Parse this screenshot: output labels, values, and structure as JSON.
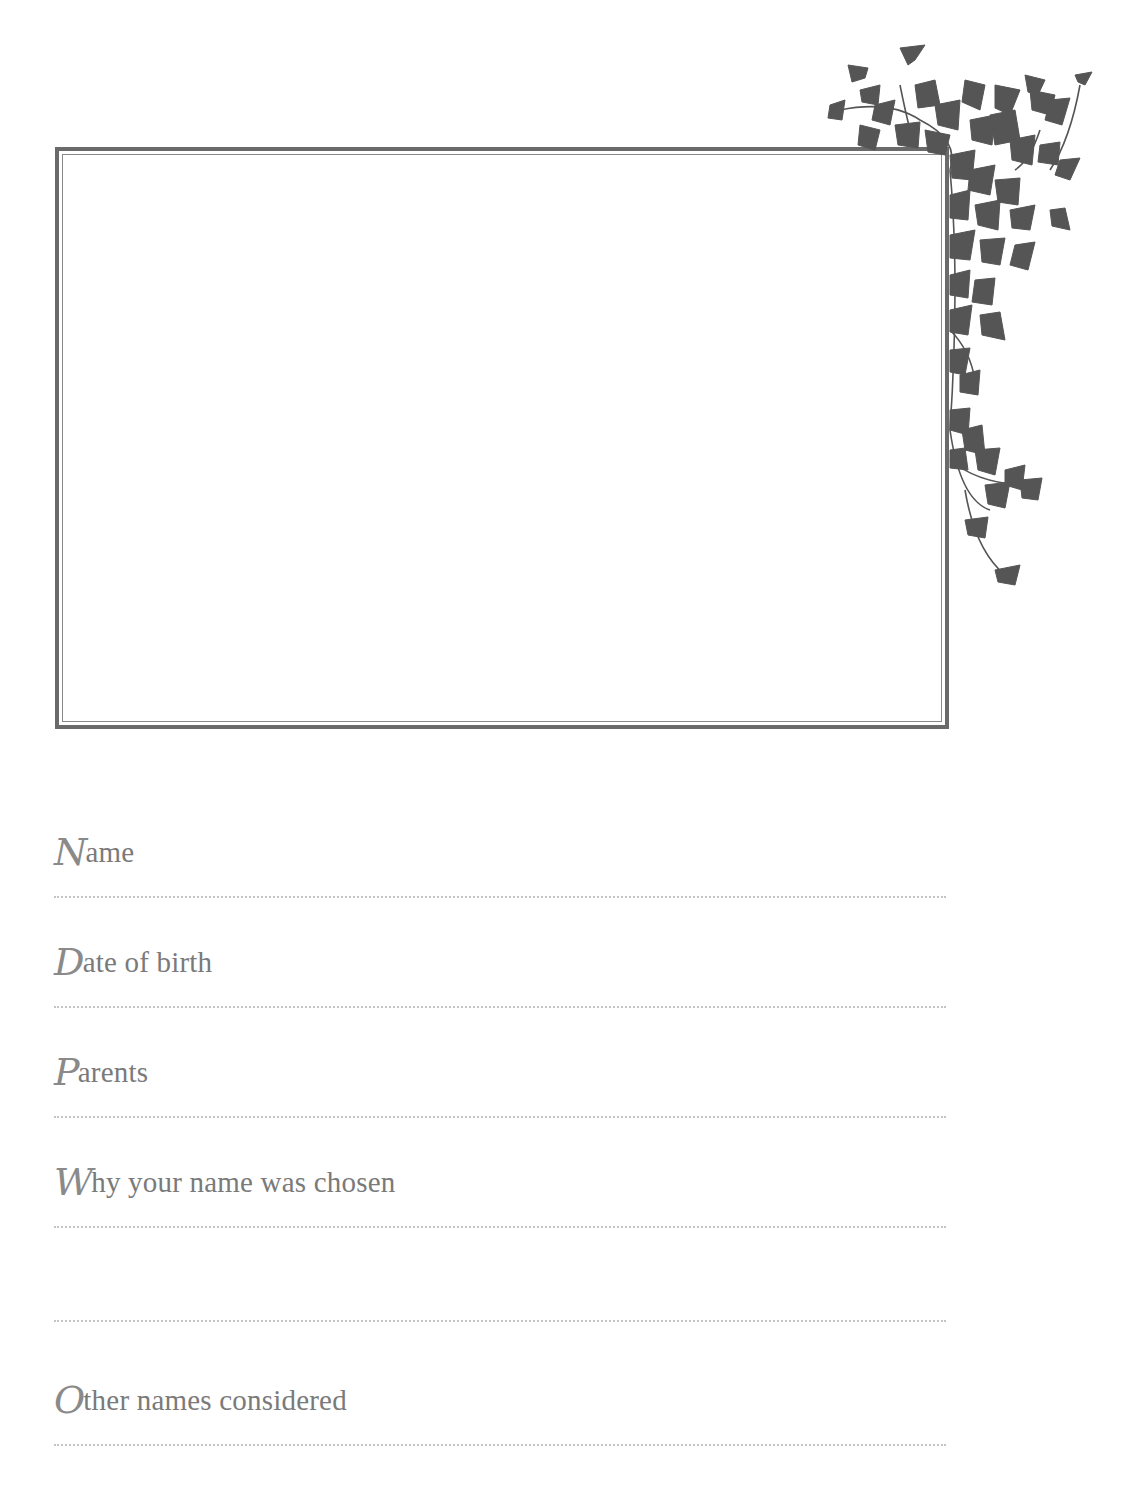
{
  "page": {
    "type": "keepsake-record-page",
    "colors": {
      "frame_outer": "#6a6a6a",
      "frame_inner": "#8a8a8a",
      "ivy": "#555555",
      "label_text": "#7a7a7a",
      "dotted_rule": "#c4c4c4",
      "background": "#ffffff"
    }
  },
  "photo_frame": {
    "decoration_icon": "ivy-vine-icon"
  },
  "fields": [
    {
      "initial": "N",
      "rest": "ame",
      "label": "Name",
      "value": ""
    },
    {
      "initial": "D",
      "rest": "ate of birth",
      "label": "Date of birth",
      "value": ""
    },
    {
      "initial": "P",
      "rest": "arents",
      "label": "Parents",
      "value": ""
    },
    {
      "initial": "W",
      "rest": "hy your name was chosen",
      "label": "Why your name was chosen",
      "value": "",
      "extra_lines": 1
    },
    {
      "initial": "O",
      "rest": "ther names considered",
      "label": "Other names considered",
      "value": ""
    }
  ]
}
